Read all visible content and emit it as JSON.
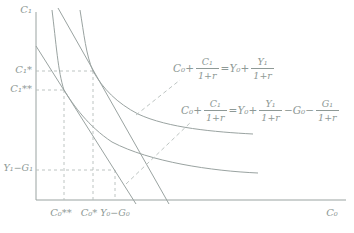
{
  "colors": {
    "stroke": "#9aa3a1",
    "dashed": "#b5bdbb",
    "text": "#8e9996",
    "background": "#ffffff"
  },
  "axes": {
    "y_title": "C₁",
    "x_title": "C₀"
  },
  "ticks": {
    "c1_star": "C₁*",
    "c1_double_star": "C₁**",
    "y1_minus_g1": "Y₁−G₁",
    "c0_double_star": "C₀**",
    "c0_star": "C₀*",
    "y0_minus_g0": "Y₀−G₀"
  },
  "equations": {
    "budget_no_gov": {
      "tokens": [
        {
          "t": "txt",
          "v": "C₀+"
        },
        {
          "t": "frac",
          "n": "C₁",
          "d": "1+r"
        },
        {
          "t": "txt",
          "v": "=Y₀+"
        },
        {
          "t": "frac",
          "n": "Y₁",
          "d": "1+r"
        }
      ]
    },
    "budget_with_gov": {
      "tokens": [
        {
          "t": "txt",
          "v": "C₀+"
        },
        {
          "t": "frac",
          "n": "C₁",
          "d": "1+r"
        },
        {
          "t": "txt",
          "v": "=Y₀+"
        },
        {
          "t": "frac",
          "n": "Y₁",
          "d": "1+r"
        },
        {
          "t": "txt",
          "v": "−G₀−"
        },
        {
          "t": "frac",
          "n": "G₁",
          "d": "1+r"
        }
      ]
    }
  },
  "chart_data": {
    "type": "line",
    "title": "",
    "xlabel": "C₀",
    "ylabel": "C₁",
    "axes_numeric": false,
    "grid": false,
    "elements": [
      {
        "kind": "budget-line",
        "visible_label": "C₀+C₁/(1+r)=Y₀+Y₁/(1+r)",
        "position": "outer (right) straight line"
      },
      {
        "kind": "budget-line",
        "visible_label": "C₀+C₁/(1+r)=Y₀+Y₁/(1+r)−G₀−G₁/(1+r)",
        "position": "inner (left) straight line"
      },
      {
        "kind": "indifference-curve",
        "tangency_point_labels": [
          "C₀*",
          "C₁*"
        ],
        "tangent_to": "outer budget line"
      },
      {
        "kind": "indifference-curve",
        "tangency_point_labels": [
          "C₀**",
          "C₁**"
        ],
        "tangent_to": "inner budget line"
      },
      {
        "kind": "marked-point",
        "x_label": "Y₀−G₀",
        "y_label": "Y₁−G₁",
        "note": "dashed guides to both axes"
      },
      {
        "kind": "dashed-guides",
        "x_axis_marks": [
          "C₀**",
          "C₀*",
          "Y₀−G₀"
        ],
        "y_axis_marks": [
          "C₁*",
          "C₁**",
          "Y₁−G₁"
        ]
      }
    ]
  }
}
